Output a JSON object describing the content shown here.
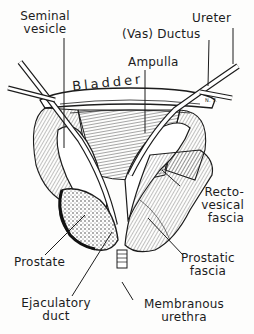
{
  "figure": {
    "type": "anatomical-illustration",
    "signature": "N. T.",
    "ink_color": "#1c1c1c",
    "background": "#fdfdfc"
  },
  "labels": {
    "seminal_vesicle": {
      "line1": "Seminal",
      "line2": "vesicle"
    },
    "vas_ductus": "(Vas) Ductus",
    "ureter": "Ureter",
    "ampulla": "Ampulla",
    "bladder": "Bladder",
    "rectovesical_fascia": {
      "line1": "Recto-",
      "line2": "vesical",
      "line3": "fascia"
    },
    "prostate": "Prostate",
    "prostatic_fascia": {
      "line1": "Prostatic",
      "line2": "fascia"
    },
    "ejaculatory_duct": {
      "line1": "Ejaculatory",
      "line2": "duct"
    },
    "membranous_urethra": {
      "line1": "Membranous",
      "line2": "urethra"
    }
  }
}
